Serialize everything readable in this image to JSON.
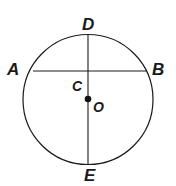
{
  "figure": {
    "kind": "circle-diagram",
    "background_color": "#ffffff",
    "stroke_color": "#1a1a1a",
    "label_color": "#1a1a1a",
    "circle": {
      "name": "circle-O",
      "center_x": 88,
      "center_y": 99.5,
      "radius": 65,
      "stroke_width": 1.2
    },
    "center_point": {
      "name": "center-point-O",
      "x": 88,
      "y": 99,
      "radius": 3.3,
      "fill": "#111111"
    },
    "chords": [
      {
        "name": "chord-AB",
        "label": "AB",
        "x1": 33,
        "y1": 71,
        "x2": 146,
        "y2": 71,
        "stroke_width": 1.1,
        "orientation": "horizontal",
        "role": "chord"
      },
      {
        "name": "diameter-DE",
        "label": "DE",
        "x1": 88,
        "y1": 35,
        "x2": 88,
        "y2": 164,
        "stroke_width": 1.1,
        "orientation": "vertical",
        "role": "diameter"
      }
    ],
    "labels": [
      {
        "name": "point-label-D",
        "text": "D",
        "x": 82,
        "y": 16,
        "size": "vertex"
      },
      {
        "name": "point-label-A",
        "text": "A",
        "x": 7,
        "y": 61,
        "size": "vertex"
      },
      {
        "name": "point-label-B",
        "text": "B",
        "x": 152,
        "y": 61,
        "size": "vertex"
      },
      {
        "name": "point-label-C",
        "text": "C",
        "x": 72,
        "y": 79,
        "size": "center"
      },
      {
        "name": "point-label-O",
        "text": "O",
        "x": 93,
        "y": 100,
        "size": "center"
      },
      {
        "name": "point-label-E",
        "text": "E",
        "x": 84,
        "y": 167,
        "size": "vertex"
      }
    ]
  }
}
